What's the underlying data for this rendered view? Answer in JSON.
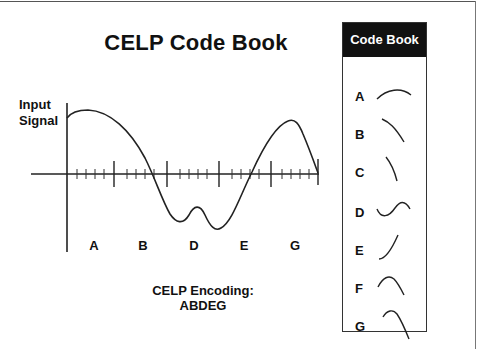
{
  "title": "CELP Code Book",
  "input_label": [
    "Input",
    "Signal"
  ],
  "segment_labels": [
    "A",
    "B",
    "D",
    "E",
    "G"
  ],
  "encoding": {
    "label": "CELP Encoding:",
    "value": "ABDEG"
  },
  "codebook": {
    "header": "Code Book",
    "entries": [
      {
        "letter": "A",
        "shape": "arch"
      },
      {
        "letter": "B",
        "shape": "falling-curve"
      },
      {
        "letter": "C",
        "shape": "steep-fall"
      },
      {
        "letter": "D",
        "shape": "s-wave"
      },
      {
        "letter": "E",
        "shape": "rising-curve"
      },
      {
        "letter": "F",
        "shape": "peak"
      },
      {
        "letter": "G",
        "shape": "peak-fall"
      }
    ]
  },
  "colors": {
    "ink": "#111111",
    "header_bg": "#111111",
    "header_text": "#ffffff",
    "background": "#ffffff"
  }
}
